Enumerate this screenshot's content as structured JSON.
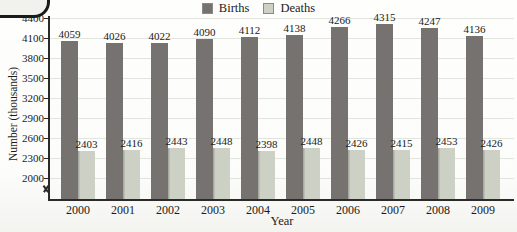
{
  "chart_data": {
    "type": "bar",
    "title": "",
    "categories": [
      "2000",
      "2001",
      "2002",
      "2003",
      "2004",
      "2005",
      "2006",
      "2007",
      "2008",
      "2009"
    ],
    "series": [
      {
        "name": "Births",
        "color": "#767270",
        "values": [
          4059,
          4026,
          4022,
          4090,
          4112,
          4138,
          4266,
          4315,
          4247,
          4136
        ]
      },
      {
        "name": "Deaths",
        "color": "#cdd0c5",
        "values": [
          2403,
          2416,
          2443,
          2448,
          2398,
          2448,
          2426,
          2415,
          2453,
          2426
        ]
      }
    ],
    "xlabel": "Year",
    "ylabel": "Number (thousands)",
    "yticks": [
      2000,
      2300,
      2600,
      2900,
      3200,
      3500,
      3800,
      4100,
      4400
    ],
    "ylim": [
      2000,
      4400
    ],
    "axis_break": true,
    "grid": true,
    "legend_position": "top",
    "value_labels": true,
    "colors": {
      "axis": "#2a2a2a",
      "gridline": "#e2e5dd",
      "text": "#1b1b1b"
    }
  }
}
